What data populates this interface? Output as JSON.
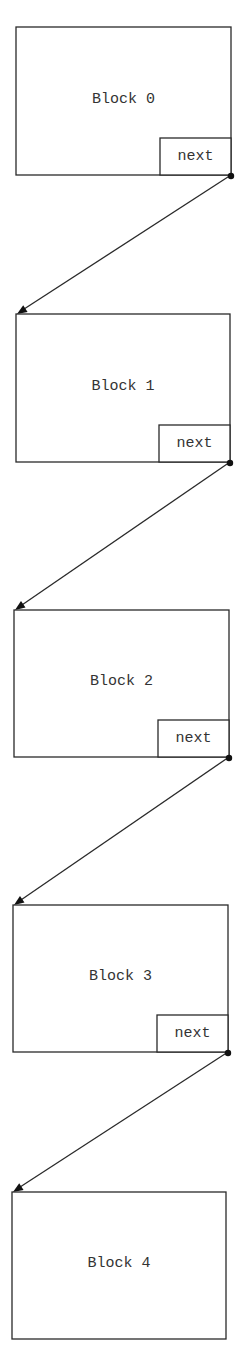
{
  "diagram": {
    "type": "linked-list",
    "blocks": [
      {
        "label": "Block 0",
        "next_label": "next",
        "has_next": true
      },
      {
        "label": "Block 1",
        "next_label": "next",
        "has_next": true
      },
      {
        "label": "Block 2",
        "next_label": "next",
        "has_next": true
      },
      {
        "label": "Block 3",
        "next_label": "next",
        "has_next": true
      },
      {
        "label": "Block 4",
        "next_label": "",
        "has_next": false
      }
    ],
    "colors": {
      "stroke": "#2a2a2a",
      "text": "#333333",
      "background": "#ffffff"
    }
  }
}
